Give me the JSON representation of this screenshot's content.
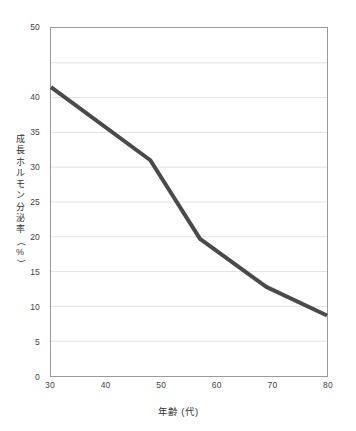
{
  "chart_data": {
    "type": "line",
    "title": "",
    "subtitle": "",
    "xlabel": "年齢 (代)",
    "ylabel": "成長ホルモン分泌率 (%)",
    "ylabel_chars": [
      "成",
      "長",
      "ホ",
      "ル",
      "モ",
      "ン",
      "分",
      "泌",
      "率",
      "（",
      "%",
      "）"
    ],
    "xlim": [
      30,
      80
    ],
    "ylim": [
      0,
      50
    ],
    "xticks": [
      30,
      40,
      50,
      60,
      70,
      80
    ],
    "xtick_labels": [
      "30",
      "40",
      "50",
      "60",
      "70",
      "80"
    ],
    "yticks": [
      0,
      5,
      10,
      15,
      20,
      25,
      30,
      35,
      40,
      45,
      50
    ],
    "ytick_labels": [
      "0",
      "5",
      "10",
      "15",
      "20",
      "25",
      "30",
      "35",
      "40",
      "",
      "50"
    ],
    "grid": true,
    "grid_axis": "y",
    "grid_color": "#e2e2e2",
    "frame_color": "#9a9a9a",
    "legend": false,
    "legend_position": "none",
    "background": "#ffffff",
    "series": [
      {
        "name": "成長ホルモン分泌率",
        "color": "#4a4a4a",
        "line_width": 4,
        "markers": false,
        "x": [
          30,
          48,
          57,
          69,
          80
        ],
        "values": [
          41.5,
          31.0,
          19.7,
          12.8,
          8.7
        ]
      }
    ],
    "annotations": []
  }
}
